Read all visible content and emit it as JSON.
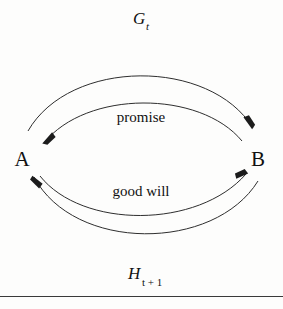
{
  "figure": {
    "nodes": [
      {
        "id": "A",
        "label": "A",
        "x": 22,
        "y": 159
      },
      {
        "id": "B",
        "label": "B",
        "x": 252,
        "y": 159
      }
    ],
    "edges": [
      {
        "id": "G",
        "label_main": "G",
        "label_sub": "t",
        "from": "A",
        "to": "B",
        "direction": "A-to-B",
        "curvature": "outer-top"
      },
      {
        "id": "promise",
        "label": "promise",
        "from": "B",
        "to": "A",
        "direction": "B-to-A",
        "curvature": "inner-top"
      },
      {
        "id": "good-will",
        "label": "good will",
        "from": "A",
        "to": "B",
        "direction": "A-to-B",
        "curvature": "inner-bottom"
      },
      {
        "id": "H",
        "label_main": "H",
        "label_sub": "t + 1",
        "from": "B",
        "to": "A",
        "direction": "B-to-A",
        "curvature": "outer-bottom"
      }
    ],
    "colors": {
      "stroke": "#2e2e2e",
      "text": "#111111",
      "background": "#fdfdfc",
      "rule": "#3a3a3a"
    }
  }
}
